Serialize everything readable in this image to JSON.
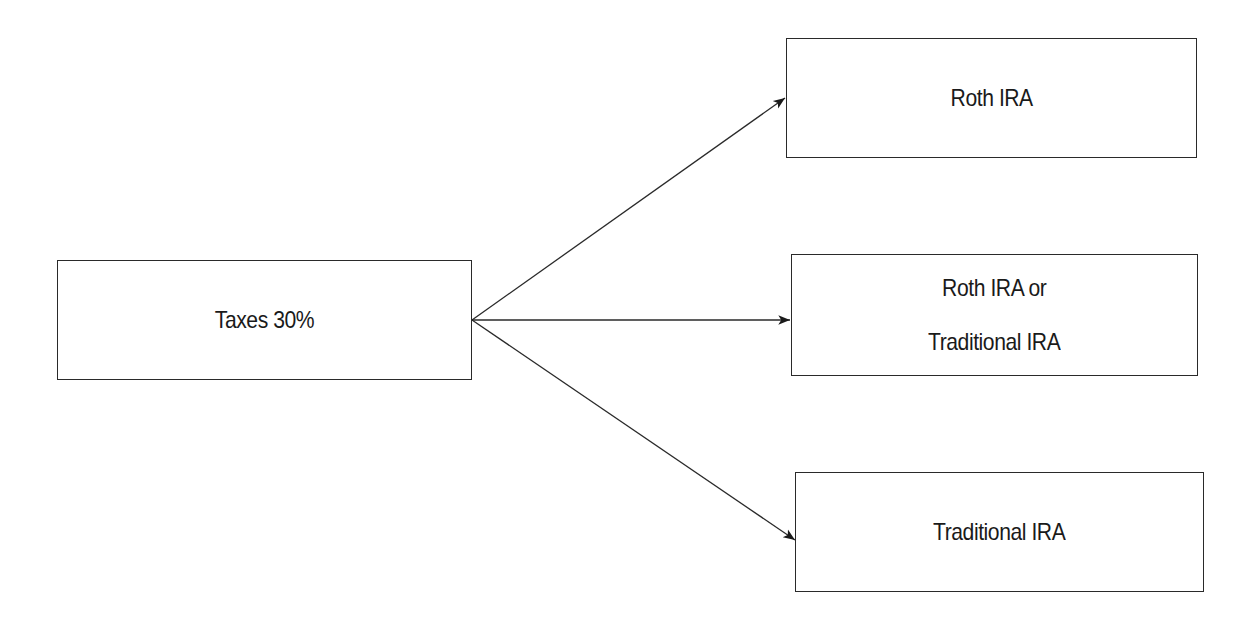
{
  "diagram": {
    "source": {
      "label": "Taxes 30%"
    },
    "targets": [
      {
        "lines": [
          "Roth IRA"
        ]
      },
      {
        "lines": [
          "Roth IRA or",
          "Traditional IRA"
        ]
      },
      {
        "lines": [
          "Traditional IRA"
        ]
      }
    ],
    "edges": [
      {
        "from": "Taxes 30%",
        "to": "Roth IRA"
      },
      {
        "from": "Taxes 30%",
        "to": "Roth IRA or Traditional IRA"
      },
      {
        "from": "Taxes 30%",
        "to": "Traditional IRA"
      }
    ],
    "colors": {
      "stroke": "#2a2a2a",
      "background": "#ffffff",
      "text": "#1a1a1a"
    }
  }
}
